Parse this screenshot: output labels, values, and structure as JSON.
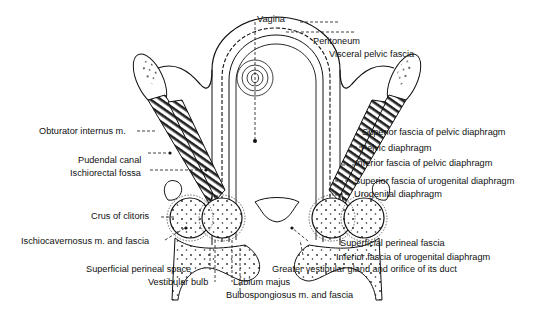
{
  "figure": {
    "labels": {
      "vagina": "Vagina",
      "peritoneum": "Peritoneum",
      "visceral_pelvic_fascia": "Visceral pelvic fascia",
      "obturator_internus": "Obturator internus m.",
      "pudendal_canal": "Pudendal canal",
      "ischiorectal_fossa": "Ischiorectal fossa",
      "superior_fascia_pelvic_diaphragm": "Superior fascia of pelvic diaphragm",
      "pelvic_diaphragm": "Pelvic diaphragm",
      "inferior_fascia_pelvic_diaphragm": "Inferior fascia of pelvic diaphragm",
      "superior_fascia_urogenital_diaphragm": "Superior fascia of urogenital diaphragm",
      "urogenital_diaphragm": "Urogenital diaphragm",
      "crus_of_clitoris": "Crus of clitoris",
      "ischiocavernosus": "Ischiocavernosus m. and fascia",
      "superficial_perineal_fascia": "Superficial perineal fascia",
      "inferior_fascia_urogenital_diaphragm": "Inferior fascia of urogenital diaphragm",
      "superficial_perineal_space": "Superficial perineal space",
      "greater_vestibular_gland": "Greater vestibular gland and orifice of its duct",
      "vestibular_bulb": "Vestibular bulb",
      "labium_majus": "Labium majus",
      "bulbospongiosus": "Bulbospongiosus m. and fascia"
    },
    "colors": {
      "ink": "#111111",
      "background": "#ffffff",
      "muscle": "#2a2a2a"
    }
  }
}
